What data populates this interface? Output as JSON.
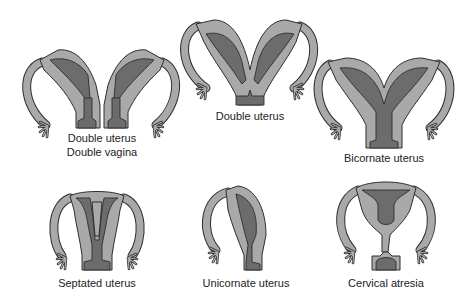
{
  "diagram": {
    "colors": {
      "tissue": "#a9a9a9",
      "cavity": "#6c6c6c",
      "outline": "#2e2e2e",
      "background": "#ffffff"
    },
    "panels": [
      {
        "id": "double-uterus-double-vagina",
        "label_lines": [
          "Double uterus",
          "Double vagina"
        ]
      },
      {
        "id": "double-uterus",
        "label_lines": [
          "Double uterus"
        ]
      },
      {
        "id": "bicornate-uterus",
        "label_lines": [
          "Bicornate uterus"
        ]
      },
      {
        "id": "septated-uterus",
        "label_lines": [
          "Septated uterus"
        ]
      },
      {
        "id": "unicornate-uterus",
        "label_lines": [
          "Unicornate uterus"
        ]
      },
      {
        "id": "cervical-atresia",
        "label_lines": [
          "Cervical atresia"
        ]
      }
    ]
  }
}
